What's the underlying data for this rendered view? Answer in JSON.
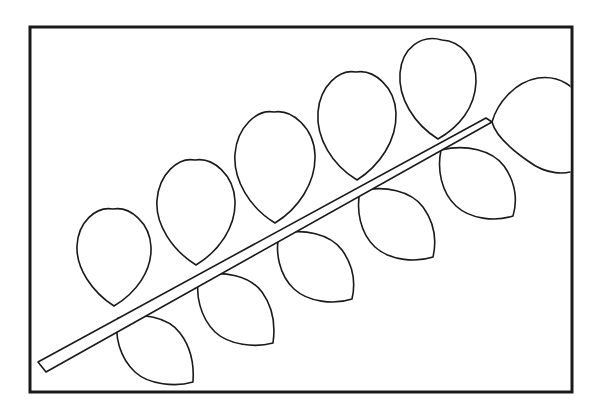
{
  "document": {
    "title": "Leaf Branch Coloring Page",
    "type": "line-art",
    "description": "Black outline drawing of a branch with leaves inside a rectangular frame",
    "background_color": "#ffffff",
    "stroke_color": "#1a1a1a",
    "fill_color": "#ffffff",
    "canvas": {
      "width": 599,
      "height": 417
    }
  },
  "frame": {
    "label": "picture-frame-border",
    "x": 30,
    "y": 27,
    "width": 542,
    "height": 365,
    "stroke_width": 3,
    "stroke_color": "#1a1a1a"
  },
  "branch": {
    "label": "main-stem",
    "stroke_width": 1.6,
    "stroke_color": "#1a1a1a",
    "base_point": {
      "x": 42,
      "y": 368
    },
    "tip_point": {
      "x": 492,
      "y": 122
    },
    "base_width": 11,
    "tip_width": 1,
    "outline": "M 38 362 L 486 118 L 492 122 L 46 372 Z"
  },
  "leaves": {
    "count": 11,
    "upper_row_label": "upper-pointed-leaves",
    "upper_count": 5,
    "lower_row_label": "lower-rounded-leaves",
    "lower_count": 5,
    "terminal_label": "terminal-leaf",
    "terminal_count": 1,
    "items": [
      {
        "name": "upper-leaf-1",
        "row": "upper",
        "index": 1,
        "attach": {
          "x": 114,
          "y": 306
        },
        "tip": {
          "x": 113,
          "y": 209
        },
        "path": "M 114 306 C 92 292 76 268 77 246 C 78 222 96 206 113 209 C 130 206 150 223 151 247 C 152 271 136 293 114 306 Z"
      },
      {
        "name": "upper-leaf-2",
        "row": "upper",
        "index": 2,
        "attach": {
          "x": 196,
          "y": 265
        },
        "tip": {
          "x": 194,
          "y": 160
        },
        "path": "M 196 265 C 172 250 155 224 157 200 C 159 174 178 157 195 160 C 213 157 234 175 235 201 C 236 227 219 251 196 265 Z"
      },
      {
        "name": "upper-leaf-3",
        "row": "upper",
        "index": 3,
        "attach": {
          "x": 275,
          "y": 223
        },
        "tip": {
          "x": 274,
          "y": 112
        },
        "path": "M 275 223 C 250 208 233 180 235 154 C 237 127 257 109 274 112 C 292 109 314 128 315 155 C 316 183 298 209 275 223 Z"
      },
      {
        "name": "upper-leaf-4",
        "row": "upper",
        "index": 4,
        "attach": {
          "x": 357,
          "y": 180
        },
        "tip": {
          "x": 356,
          "y": 72
        },
        "path": "M 357 180 C 332 165 316 138 318 112 C 320 86 339 69 356 72 C 374 69 395 87 396 113 C 397 141 379 166 357 180 Z"
      },
      {
        "name": "upper-leaf-5",
        "row": "upper",
        "index": 5,
        "attach": {
          "x": 438,
          "y": 139
        },
        "tip": {
          "x": 442,
          "y": 40
        },
        "path": "M 438 139 C 414 124 398 98 400 73 C 402 48 421 34 442 40 C 460 41 477 58 476 82 C 475 108 459 127 438 139 Z"
      },
      {
        "name": "terminal-leaf",
        "row": "terminal",
        "index": 6,
        "attach": {
          "x": 492,
          "y": 122
        },
        "tip_clipped": true,
        "path": "M 492 122 C 497 104 514 82 538 78 C 560 75 577 87 582 104 L 582 167 C 566 177 545 174 528 161 C 508 147 495 134 492 122 Z"
      },
      {
        "name": "lower-leaf-1",
        "row": "lower",
        "index": 1,
        "attach": {
          "x": 118,
          "y": 318
        },
        "tip": {
          "x": 193,
          "y": 382
        },
        "path": "M 118 318 C 142 312 168 317 180 333 C 193 350 194 368 193 382 C 176 387 149 385 135 372 C 120 358 114 336 118 318 Z"
      },
      {
        "name": "lower-leaf-2",
        "row": "lower",
        "index": 2,
        "attach": {
          "x": 199,
          "y": 276
        },
        "tip": {
          "x": 273,
          "y": 343
        },
        "path": "M 199 276 C 224 270 250 276 262 292 C 275 310 275 329 273 343 C 255 348 229 345 215 332 C 200 317 195 294 199 276 Z"
      },
      {
        "name": "lower-leaf-3",
        "row": "lower",
        "index": 3,
        "attach": {
          "x": 279,
          "y": 234
        },
        "tip": {
          "x": 352,
          "y": 299
        },
        "path": "M 279 234 C 304 228 330 234 342 250 C 355 268 355 286 352 299 C 334 305 308 302 294 289 C 279 275 275 252 279 234 Z"
      },
      {
        "name": "lower-leaf-4",
        "row": "lower",
        "index": 4,
        "attach": {
          "x": 360,
          "y": 191
        },
        "tip": {
          "x": 433,
          "y": 257
        },
        "path": "M 360 191 C 385 185 411 191 423 207 C 436 225 436 244 433 257 C 415 263 389 260 375 247 C 360 233 356 210 360 191 Z"
      },
      {
        "name": "lower-leaf-5",
        "row": "lower",
        "index": 5,
        "attach": {
          "x": 441,
          "y": 150
        },
        "tip": {
          "x": 513,
          "y": 216
        },
        "path": "M 441 150 C 466 144 492 150 504 166 C 517 184 517 203 513 216 C 495 222 470 219 456 206 C 441 192 437 169 441 150 Z"
      }
    ]
  }
}
